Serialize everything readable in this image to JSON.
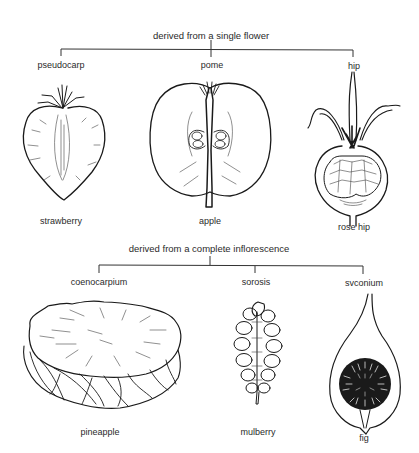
{
  "groups": [
    {
      "heading": "derived from a single flower",
      "types": [
        {
          "category": "pseudocarp",
          "example": "strawberry"
        },
        {
          "category": "pome",
          "example": "apple"
        },
        {
          "category": "hip",
          "example": "rose hip"
        }
      ]
    },
    {
      "heading": "derived from a complete inflorescence",
      "types": [
        {
          "category": "coenocarpium",
          "example": "pineapple"
        },
        {
          "category": "sorosis",
          "example": "mulberry"
        },
        {
          "category": "svconium",
          "example": "fig"
        }
      ]
    }
  ]
}
